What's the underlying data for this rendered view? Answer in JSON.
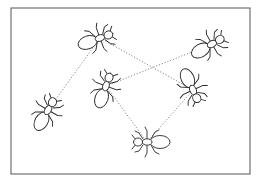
{
  "figure": {
    "frame": {
      "x": 11,
      "y": 8,
      "width": 239,
      "height": 166,
      "stroke": "#555555"
    },
    "colors": {
      "ant_stroke": "#2a2a2a",
      "link": "#8a8a8a",
      "background": "#ffffff"
    },
    "ants": [
      {
        "id": "ant-top-left",
        "x": 100,
        "y": 38,
        "angle": -20,
        "label": ""
      },
      {
        "id": "ant-top-right",
        "x": 212,
        "y": 44,
        "angle": -30,
        "label": ""
      },
      {
        "id": "ant-center",
        "x": 106,
        "y": 86,
        "angle": -70,
        "label": ""
      },
      {
        "id": "ant-left",
        "x": 48,
        "y": 110,
        "angle": -60,
        "label": ""
      },
      {
        "id": "ant-right",
        "x": 193,
        "y": 90,
        "angle": 65,
        "label": ""
      },
      {
        "id": "ant-bottom",
        "x": 147,
        "y": 142,
        "angle": 180,
        "label": ""
      }
    ],
    "links": [
      {
        "from": "ant-top-left",
        "to": "ant-left"
      },
      {
        "from": "ant-top-left",
        "to": "ant-right"
      },
      {
        "from": "ant-center",
        "to": "ant-top-right"
      },
      {
        "from": "ant-center",
        "to": "ant-bottom"
      },
      {
        "from": "ant-right",
        "to": "ant-bottom"
      }
    ],
    "caption": ""
  }
}
